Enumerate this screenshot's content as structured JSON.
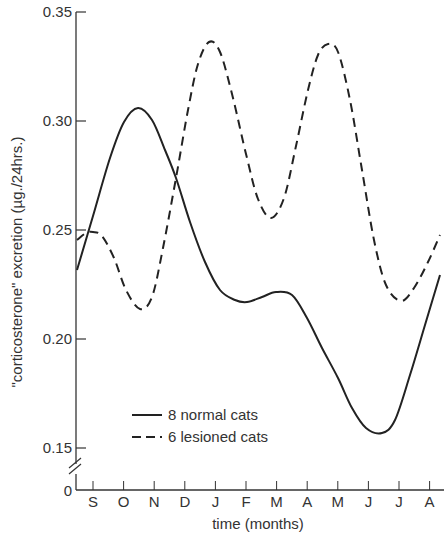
{
  "chart_data": {
    "type": "line",
    "title": "",
    "xlabel": "time (months)",
    "ylabel": "\"corticosterone\" excretion (µg./24hrs.)",
    "categories": [
      "S",
      "O",
      "N",
      "D",
      "J",
      "F",
      "M",
      "A",
      "M",
      "J",
      "J",
      "A"
    ],
    "ylim": [
      0,
      0.35
    ],
    "axis_break": {
      "from": 0,
      "to": 0.15
    },
    "yticks": [
      "0",
      "0.15",
      "0.20",
      "0.25",
      "0.30",
      "0.35"
    ],
    "grid": false,
    "legend_position": "lower-left inside",
    "series": [
      {
        "name": "8 normal cats",
        "style": "solid",
        "values": [
          0.257,
          0.3,
          0.296,
          0.264,
          0.232,
          0.217,
          0.222,
          0.209,
          0.183,
          0.159,
          0.181,
          0.222
        ],
        "start_value": 0.232,
        "end_value": 0.229
      },
      {
        "name": "6 lesioned cats",
        "style": "dashed",
        "values": [
          0.249,
          0.222,
          0.216,
          0.262,
          0.335,
          0.303,
          0.255,
          0.3,
          0.335,
          0.288,
          0.217,
          0.24
        ],
        "start_value": 0.245,
        "end_value": 0.247
      }
    ]
  },
  "axis": {
    "y_tick_labels": [
      "0.35",
      "0.30",
      "0.25",
      "0.20",
      "0.15"
    ],
    "y_zero_label": "0",
    "x_title": "time (months)",
    "y_title": "\"corticosterone\" excretion (µg./24hrs.)"
  },
  "legend": {
    "normal": "8 normal cats",
    "lesioned": "6 lesioned cats"
  },
  "curves": {
    "solid": [
      [
        77,
        270
      ],
      [
        93,
        216
      ],
      [
        110,
        158
      ],
      [
        124,
        122
      ],
      [
        138,
        108
      ],
      [
        152,
        120
      ],
      [
        165,
        150
      ],
      [
        176,
        178
      ],
      [
        190,
        222
      ],
      [
        205,
        262
      ],
      [
        220,
        290
      ],
      [
        235,
        300
      ],
      [
        247,
        302
      ],
      [
        262,
        297
      ],
      [
        276,
        292
      ],
      [
        292,
        295
      ],
      [
        307,
        318
      ],
      [
        322,
        348
      ],
      [
        338,
        378
      ],
      [
        352,
        408
      ],
      [
        366,
        428
      ],
      [
        382,
        433
      ],
      [
        395,
        420
      ],
      [
        410,
        375
      ],
      [
        425,
        325
      ],
      [
        440,
        275
      ]
    ],
    "dashed": [
      [
        77,
        240
      ],
      [
        86,
        233
      ],
      [
        93,
        232
      ],
      [
        102,
        236
      ],
      [
        114,
        258
      ],
      [
        126,
        290
      ],
      [
        140,
        309
      ],
      [
        152,
        297
      ],
      [
        163,
        248
      ],
      [
        176,
        178
      ],
      [
        188,
        110
      ],
      [
        198,
        64
      ],
      [
        209,
        42
      ],
      [
        220,
        52
      ],
      [
        233,
        98
      ],
      [
        246,
        154
      ],
      [
        258,
        199
      ],
      [
        271,
        218
      ],
      [
        284,
        198
      ],
      [
        296,
        146
      ],
      [
        308,
        90
      ],
      [
        318,
        55
      ],
      [
        328,
        44
      ],
      [
        338,
        52
      ],
      [
        350,
        100
      ],
      [
        362,
        170
      ],
      [
        374,
        240
      ],
      [
        386,
        285
      ],
      [
        401,
        301
      ],
      [
        414,
        288
      ],
      [
        428,
        262
      ],
      [
        440,
        235
      ]
    ]
  }
}
